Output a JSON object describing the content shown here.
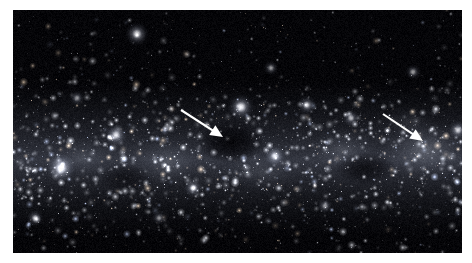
{
  "image": {
    "subject": "milky-way-star-field",
    "description": "Wide-field astronomical photograph of a dense Milky Way star field with diffuse nebulosity and dark nebulae",
    "frame": {
      "x": 13,
      "y": 10,
      "width": 449,
      "height": 243
    },
    "background_color": "#ffffff",
    "sky_color": "#050508"
  },
  "annotations": {
    "arrow_color": "#ffffff",
    "arrows": [
      {
        "name": "left-arrow",
        "target": "dark-nebula",
        "x1": 168,
        "y1": 100,
        "x2": 210,
        "y2": 127,
        "head_size": 9,
        "stroke_width": 2.1
      },
      {
        "name": "right-arrow",
        "target": "bright-nebula",
        "x1": 370,
        "y1": 104,
        "x2": 410,
        "y2": 131,
        "head_size": 9,
        "stroke_width": 2.1
      }
    ]
  },
  "sky": {
    "band": {
      "name": "milky-way-band",
      "center_y": 150,
      "thickness": 78,
      "glow_color": "#6e7384"
    },
    "nebulae": [
      {
        "name": "bright-nebula-right",
        "cx": 412,
        "cy": 140,
        "rx": 44,
        "ry": 30,
        "brightness": 0.62,
        "color": "#b6bccb"
      },
      {
        "name": "nebula-mid-right",
        "cx": 330,
        "cy": 140,
        "rx": 34,
        "ry": 22,
        "brightness": 0.4,
        "color": "#9aa0b0"
      },
      {
        "name": "nebula-mid-left",
        "cx": 155,
        "cy": 152,
        "rx": 36,
        "ry": 24,
        "brightness": 0.42,
        "color": "#9aa0b0"
      },
      {
        "name": "nebula-left-edge",
        "cx": 70,
        "cy": 148,
        "rx": 32,
        "ry": 20,
        "brightness": 0.3,
        "color": "#888e9c"
      },
      {
        "name": "nebula-low-center",
        "cx": 250,
        "cy": 162,
        "rx": 40,
        "ry": 20,
        "brightness": 0.26,
        "color": "#82889a"
      },
      {
        "name": "nebula-upper-right",
        "cx": 395,
        "cy": 112,
        "rx": 26,
        "ry": 16,
        "brightness": 0.22,
        "color": "#7c8292"
      }
    ],
    "dark_nebulae": [
      {
        "name": "dark-nebula-center",
        "cx": 218,
        "cy": 132,
        "rx": 34,
        "ry": 22,
        "opacity": 0.95
      },
      {
        "name": "dark-lane-right",
        "cx": 352,
        "cy": 158,
        "rx": 30,
        "ry": 16,
        "opacity": 0.72
      },
      {
        "name": "dark-lane-left",
        "cx": 112,
        "cy": 168,
        "rx": 26,
        "ry": 14,
        "opacity": 0.55
      }
    ],
    "bright_stars": [
      {
        "name": "star-a",
        "x": 48,
        "y": 158,
        "r": 3.4,
        "mag": 1.0
      },
      {
        "name": "star-b",
        "x": 228,
        "y": 97,
        "r": 3.1,
        "mag": 0.95
      },
      {
        "name": "star-c",
        "x": 124,
        "y": 24,
        "r": 2.8,
        "mag": 0.9
      },
      {
        "name": "star-d",
        "x": 103,
        "y": 125,
        "r": 2.6,
        "mag": 0.85
      },
      {
        "name": "star-e",
        "x": 262,
        "y": 146,
        "r": 2.5,
        "mag": 0.82
      },
      {
        "name": "star-f",
        "x": 294,
        "y": 95,
        "r": 2.2,
        "mag": 0.75
      },
      {
        "name": "star-g",
        "x": 180,
        "y": 178,
        "r": 2.2,
        "mag": 0.72
      },
      {
        "name": "star-h",
        "x": 445,
        "y": 120,
        "r": 2.3,
        "mag": 0.78
      },
      {
        "name": "star-i",
        "x": 338,
        "y": 108,
        "r": 2.0,
        "mag": 0.68
      },
      {
        "name": "star-j",
        "x": 22,
        "y": 208,
        "r": 2.0,
        "mag": 0.66
      },
      {
        "name": "star-k",
        "x": 400,
        "y": 62,
        "r": 1.9,
        "mag": 0.62
      },
      {
        "name": "star-l",
        "x": 258,
        "y": 58,
        "r": 1.8,
        "mag": 0.6
      },
      {
        "name": "star-m",
        "x": 64,
        "y": 88,
        "r": 1.8,
        "mag": 0.58
      },
      {
        "name": "star-n",
        "x": 312,
        "y": 196,
        "r": 1.8,
        "mag": 0.58
      },
      {
        "name": "star-o",
        "x": 146,
        "y": 208,
        "r": 1.7,
        "mag": 0.55
      }
    ],
    "field_star_count": 4200,
    "seed": 20240917
  }
}
